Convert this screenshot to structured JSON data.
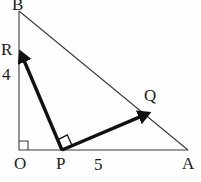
{
  "figure": {
    "kind": "geometry-diagram",
    "background_color": "#fefefe",
    "thin_line_color": "#3a3a3a",
    "thick_line_color": "#111111",
    "label_color": "#1c1c1c",
    "thin_line_width": 1.1,
    "thick_line_width": 3.4
  },
  "points": {
    "O": {
      "label": "O",
      "x": 19,
      "y": 150
    },
    "A": {
      "label": "A",
      "x": 188,
      "y": 150
    },
    "B": {
      "label": "B",
      "x": 19,
      "y": 11
    },
    "P": {
      "label": "P",
      "x": 62,
      "y": 150
    },
    "Q": {
      "label": "Q",
      "x": 147,
      "y": 113
    },
    "R": {
      "label": "R",
      "x": 21,
      "y": 53
    }
  },
  "segments": [
    {
      "name": "vertical-leg-OB",
      "from": "O",
      "to": "B",
      "style": "thin"
    },
    {
      "name": "horizontal-leg-OA",
      "from": "O",
      "to": "A",
      "style": "thin"
    },
    {
      "name": "hypotenuse-BA",
      "from": "B",
      "to": "A",
      "style": "thin"
    }
  ],
  "vectors": [
    {
      "name": "vector-PR",
      "from": "P",
      "to": "R",
      "style": "thick",
      "arrowhead": "at-end"
    },
    {
      "name": "vector-PQ",
      "from": "P",
      "to": "Q",
      "style": "thick",
      "arrowhead": "at-end"
    }
  ],
  "right_angles": [
    {
      "name": "right-angle-at-O",
      "at": "O",
      "size": 9
    },
    {
      "name": "right-angle-at-P",
      "at": "P",
      "size": 10
    }
  ],
  "labels": {
    "B": "B",
    "R": "R",
    "four": "4",
    "Q": "Q",
    "O": "O",
    "P": "P",
    "five": "5",
    "A": "A"
  },
  "measurements": {
    "OR_length": "4",
    "PA_length": "5"
  }
}
